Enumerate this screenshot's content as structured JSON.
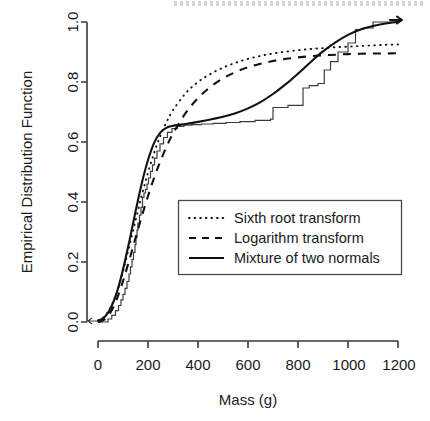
{
  "chart_data": {
    "type": "line",
    "title": "",
    "xlabel": "Mass (g)",
    "ylabel": "Empirical Distribution Function",
    "xlim": [
      0,
      1200
    ],
    "ylim": [
      0.0,
      1.0
    ],
    "xticks": [
      0,
      200,
      400,
      600,
      800,
      1000,
      1200
    ],
    "xticklabels": [
      "0",
      "200",
      "400",
      "600",
      "800",
      "1000",
      "1200"
    ],
    "yticks": [
      0.0,
      0.2,
      0.4,
      0.6,
      0.8,
      1.0
    ],
    "yticklabels": [
      "0.0",
      "0.2",
      "0.4",
      "0.6",
      "0.8",
      "1.0"
    ],
    "grid": false,
    "legend_position": "center",
    "series": [
      {
        "name": "Sixth root transform",
        "style": "dotted",
        "x": [
          0,
          25,
          50,
          75,
          100,
          125,
          150,
          175,
          200,
          225,
          250,
          275,
          300,
          350,
          400,
          450,
          500,
          550,
          600,
          650,
          700,
          750,
          800,
          850,
          900,
          950,
          1000,
          1050,
          1100,
          1150,
          1200
        ],
        "y": [
          0.005,
          0.018,
          0.048,
          0.098,
          0.168,
          0.252,
          0.338,
          0.422,
          0.498,
          0.565,
          0.622,
          0.668,
          0.706,
          0.762,
          0.8,
          0.827,
          0.848,
          0.864,
          0.877,
          0.887,
          0.895,
          0.901,
          0.906,
          0.91,
          0.913,
          0.916,
          0.918,
          0.92,
          0.922,
          0.924,
          0.925
        ]
      },
      {
        "name": "Logarithm transform",
        "style": "dashed",
        "x": [
          0,
          25,
          50,
          75,
          100,
          125,
          150,
          175,
          200,
          225,
          250,
          275,
          300,
          350,
          400,
          450,
          500,
          550,
          600,
          650,
          700,
          750,
          800,
          850,
          900,
          950,
          1000,
          1050,
          1100,
          1150,
          1200
        ],
        "y": [
          0.0,
          0.008,
          0.032,
          0.076,
          0.136,
          0.206,
          0.28,
          0.352,
          0.42,
          0.482,
          0.537,
          0.586,
          0.628,
          0.696,
          0.746,
          0.784,
          0.812,
          0.833,
          0.849,
          0.861,
          0.87,
          0.877,
          0.882,
          0.886,
          0.889,
          0.891,
          0.893,
          0.894,
          0.895,
          0.895,
          0.896
        ]
      },
      {
        "name": "Mixture of two normals",
        "style": "solid",
        "x": [
          0,
          25,
          50,
          75,
          100,
          125,
          150,
          175,
          200,
          225,
          250,
          275,
          300,
          325,
          350,
          400,
          450,
          500,
          550,
          600,
          650,
          700,
          750,
          800,
          850,
          900,
          950,
          1000,
          1050,
          1100,
          1150,
          1200
        ],
        "y": [
          0.004,
          0.015,
          0.045,
          0.098,
          0.175,
          0.268,
          0.368,
          0.462,
          0.54,
          0.598,
          0.632,
          0.648,
          0.654,
          0.657,
          0.66,
          0.667,
          0.675,
          0.684,
          0.696,
          0.712,
          0.733,
          0.76,
          0.792,
          0.828,
          0.866,
          0.902,
          0.932,
          0.957,
          0.975,
          0.987,
          0.995,
          1.0
        ]
      },
      {
        "name": "Empirical distribution function",
        "style": "step",
        "x": [
          0,
          40,
          55,
          70,
          82,
          92,
          100,
          108,
          116,
          124,
          130,
          136,
          142,
          148,
          152,
          156,
          160,
          166,
          172,
          178,
          184,
          190,
          196,
          202,
          210,
          218,
          226,
          236,
          248,
          262,
          278,
          296,
          318,
          344,
          376,
          414,
          460,
          512,
          568,
          628,
          690,
          700,
          760,
          820,
          845,
          880,
          905,
          930,
          960,
          1000,
          1030,
          1060,
          1100,
          1200
        ],
        "y": [
          0.0,
          0.01,
          0.022,
          0.038,
          0.055,
          0.074,
          0.092,
          0.112,
          0.135,
          0.16,
          0.184,
          0.208,
          0.232,
          0.258,
          0.282,
          0.306,
          0.33,
          0.356,
          0.382,
          0.415,
          0.43,
          0.442,
          0.46,
          0.48,
          0.502,
          0.524,
          0.546,
          0.57,
          0.594,
          0.615,
          0.632,
          0.645,
          0.652,
          0.656,
          0.658,
          0.66,
          0.662,
          0.665,
          0.668,
          0.672,
          0.676,
          0.715,
          0.722,
          0.78,
          0.788,
          0.795,
          0.84,
          0.868,
          0.9,
          0.93,
          0.975,
          0.98,
          1.0,
          1.0
        ]
      }
    ]
  }
}
